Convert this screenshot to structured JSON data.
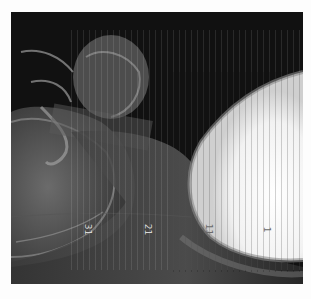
{
  "image": {
    "description": "Rotated lateral radiograph of head and neck with vertical scan lines",
    "background_color": "#fdfdfd",
    "frame_color": "#101010",
    "bright_region_color": "#f4f4f4"
  },
  "markers": [
    {
      "text": "31",
      "x": 82,
      "y": 228
    },
    {
      "text": "21",
      "x": 142,
      "y": 228
    },
    {
      "text": "11",
      "x": 203,
      "y": 228
    },
    {
      "text": "1",
      "x": 262,
      "y": 228
    }
  ]
}
